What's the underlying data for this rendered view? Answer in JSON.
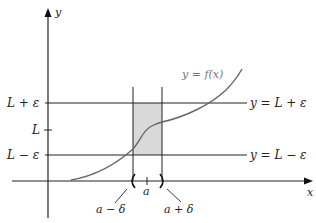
{
  "diagram": {
    "type": "epsilon-delta limit definition",
    "axes": {
      "x_label": "x",
      "y_label": "y"
    },
    "curve_label": "y = f(x)",
    "horizontal_lines": [
      {
        "left_label": "L + ε",
        "right_label": "y = L + ε"
      },
      {
        "left_label": "L − ε",
        "right_label": "y = L − ε"
      }
    ],
    "y_tick_label": "L",
    "x_tick_labels": {
      "center": "a",
      "left": "a − δ",
      "right": "a + δ"
    },
    "colors": {
      "shade": "#d9d9d9",
      "curve": "#666666",
      "lines": "#222222"
    }
  }
}
